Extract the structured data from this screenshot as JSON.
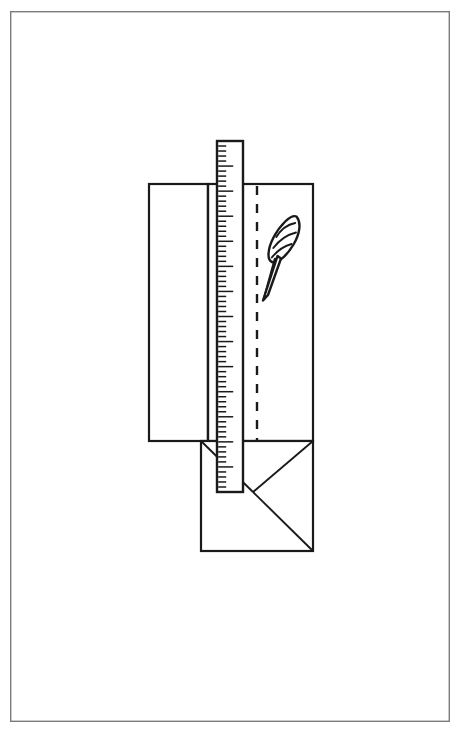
{
  "document": {
    "title": "Envelope Folding Diagram",
    "description": "Black and white line drawing of a sheet of paper being folded into an envelope, with a measuring ruler laid vertically across it and a quill feather resting on the right panel.",
    "background_color": "#ffffff",
    "ink_color": "#1a1a1a",
    "frame_color": "#7b7b7b"
  },
  "frame": {
    "name": "page-border",
    "x": 10,
    "y": 11,
    "width": 440,
    "height": 711,
    "stroke": "#7b7b7b"
  },
  "parts": {
    "left_panel": {
      "label": "left-fold-panel",
      "x": 149,
      "y": 184,
      "width": 59,
      "height": 257
    },
    "center_panel": {
      "label": "center-body-panel",
      "x": 208,
      "y": 184,
      "width": 105,
      "height": 257
    },
    "lower_panel": {
      "label": "lower-flap-panel",
      "x": 201,
      "y": 441,
      "width": 112,
      "height": 110
    },
    "vertical_crease": {
      "label": "vertical-crease",
      "x": 208,
      "y1": 184,
      "y2": 441
    },
    "horizontal_crease": {
      "label": "horizontal-crease",
      "y": 441,
      "x1": 149,
      "x2": 313
    },
    "dashed_guide": {
      "label": "dashed-fold-guide",
      "x": 257,
      "y1": 186,
      "y2": 440,
      "dash": "9 9"
    },
    "flap_diagonals": [
      {
        "label": "flap-diagonal-left",
        "x1": 201,
        "y1": 441,
        "x2": 253,
        "y2": 492
      },
      {
        "label": "flap-diagonal-right",
        "x1": 313,
        "y1": 441,
        "x2": 253,
        "y2": 492
      },
      {
        "label": "flap-diagonal-bottom",
        "x1": 253,
        "y1": 492,
        "x2": 313,
        "y2": 551
      }
    ]
  },
  "ruler": {
    "label": "measuring-ruler",
    "x": 217,
    "y": 141,
    "width": 26,
    "height": 351,
    "tick_side": "left",
    "tick_count": 70,
    "major_every": 5,
    "major_length": 15,
    "minor_length": 8,
    "stroke": "#1a1a1a"
  },
  "feather": {
    "label": "quill-feather",
    "center_x": 285,
    "center_y": 240,
    "vane_count": 3,
    "tip_x": 264,
    "tip_y": 299
  },
  "annotations": {
    "ruler_name": "Ruler",
    "feather_name": "Quill feather",
    "dashed_name": "Fold guide",
    "panel_name": "Paper sheet"
  }
}
